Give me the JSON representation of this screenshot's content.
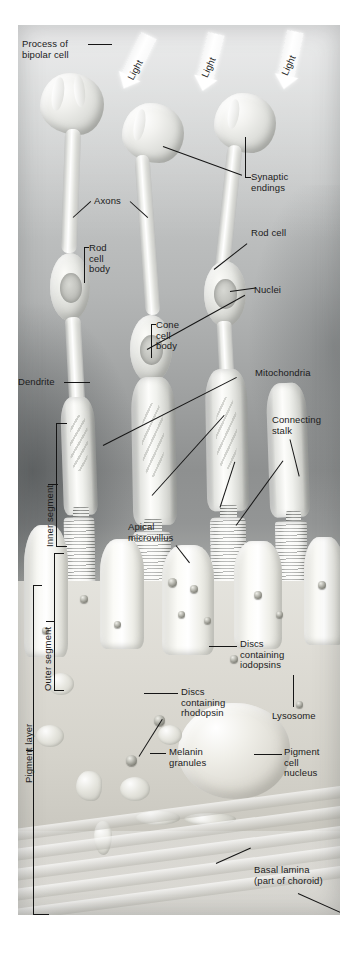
{
  "figure": {
    "background_color": "#b9bbbb",
    "page_background": "#ffffff",
    "label_color": "#1b1b1b",
    "leader_color": "#151515"
  },
  "light_arrows": [
    {
      "label": "Light"
    },
    {
      "label": "Light"
    },
    {
      "label": "Light"
    }
  ],
  "labels": {
    "process_of_bipolar_cell": "Process of\nbipolar cell",
    "synaptic_endings": "Synaptic\nendings",
    "axons": "Axons",
    "rod_cell": "Rod cell",
    "rod_cell_body": "Rod\ncell\nbody",
    "nuclei": "Nuclei",
    "cone_cell_body": "Cone\ncell\nbody",
    "dendrite": "Dendrite",
    "mitochondria": "Mitochondria",
    "connecting_stalk": "Connecting\nstalk",
    "inner_segment": "Inner segment",
    "outer_segment": "Outer segment",
    "apical_microvillus": "Apical\nmicrovillus",
    "discs_containing_iodopsins": "Discs\ncontaining\niodopsins",
    "discs_containing_rhodopsin": "Discs\ncontaining\nrhodopsin",
    "melanin_granules": "Melanin\ngranules",
    "lysosome": "Lysosome",
    "pigment_cell_nucleus": "Pigment\ncell\nnucleus",
    "pigment_layer": "Pigment layer",
    "basal_lamina": "Basal lamina\n(part of choroid)"
  }
}
